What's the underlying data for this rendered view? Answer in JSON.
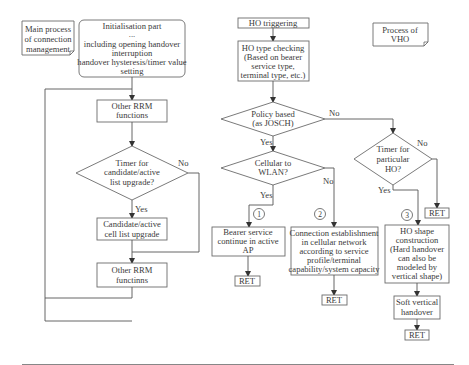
{
  "diagram": {
    "notes": {
      "main_process": [
        "Main process",
        "of connection",
        "management"
      ],
      "process_vho": [
        "Process of",
        "VHO"
      ]
    },
    "left_flow": {
      "init": [
        "Initialisation part",
        "...",
        "including opening handover",
        "interruption",
        "handover hysteresis/timer value",
        "setting"
      ],
      "other_rrm_1": [
        "Other RRM",
        "functions"
      ],
      "timer_decision": [
        "Timer for",
        "candidate/active",
        "list upgrade?"
      ],
      "yes_label": "Yes",
      "no_label": "No",
      "candidate_upgrade": [
        "Candidate/active",
        "cell list upgrade"
      ],
      "other_rrm_2": [
        "Other RRM",
        "functinns"
      ]
    },
    "right_flow": {
      "ho_triggering": "HO triggering",
      "ho_type_checking": [
        "HO type checking",
        "(Based on bearer",
        "service type,",
        "terminal type, etc.)"
      ],
      "policy_decision": [
        "Policy based",
        "(as JOSCH)"
      ],
      "policy_yes": "Yes",
      "policy_no": "No",
      "cellular_decision": [
        "Cellular to",
        "WLAN?"
      ],
      "cellular_yes": "Yes",
      "cellular_no": "No",
      "timer_decision": [
        "Timer for",
        "particular",
        "HO?"
      ],
      "timer_yes": "Yes",
      "timer_no": "No",
      "circle_1": "1",
      "circle_2": "2",
      "circle_3": "3",
      "bearer_service": [
        "Bearer service",
        "continue in active",
        "AP"
      ],
      "connection_establishment": [
        "Connection establishment",
        "in cellular network",
        "according to service",
        "profile/terminal",
        "capability/system capacity"
      ],
      "ho_shape": [
        "HO shape",
        "construction",
        "(Hard handover",
        "can also be",
        "modeled by",
        "vertical shape)"
      ],
      "soft_vertical": [
        "Soft vertical",
        "handover"
      ],
      "ret": "RET"
    }
  }
}
